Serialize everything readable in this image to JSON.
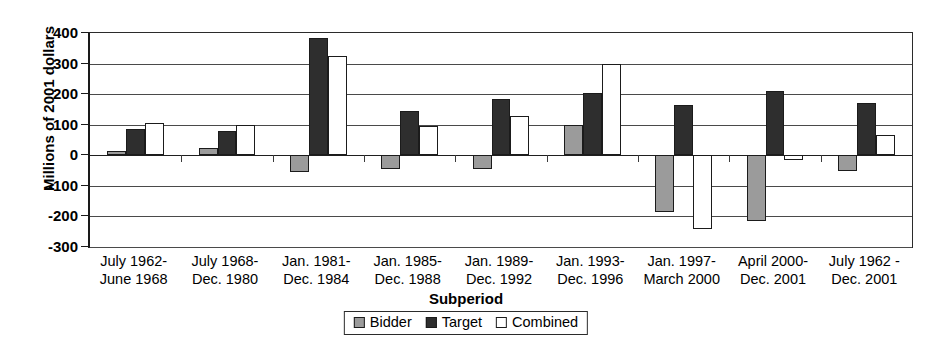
{
  "chart_data": {
    "type": "bar",
    "title": "",
    "xlabel": "Subperiod",
    "ylabel": "Millions of 2001 dollars",
    "ylim": [
      -300,
      400
    ],
    "ytick_step": 100,
    "yticks": [
      400,
      300,
      200,
      100,
      0,
      -100,
      -200,
      -300
    ],
    "ytick_labels": [
      "400",
      "300",
      "200",
      "100",
      "0",
      "-100",
      "-200",
      "-300"
    ],
    "grid": true,
    "legend_position": "bottom-center",
    "categories": [
      "July 1962-\nJune 1968",
      "July 1968-\nDec. 1980",
      "Jan. 1981-\nDec. 1984",
      "Jan. 1985-\nDec. 1988",
      "Jan. 1989-\nDec. 1992",
      "Jan. 1993-\nDec. 1996",
      "Jan. 1997-\nMarch 2000",
      "April 2000-\nDec. 2001",
      "July 1962 -\nDec. 2001"
    ],
    "category_lines": [
      [
        "July 1962-",
        "June 1968"
      ],
      [
        "July 1968-",
        "Dec. 1980"
      ],
      [
        "Jan. 1981-",
        "Dec. 1984"
      ],
      [
        "Jan. 1985-",
        "Dec. 1988"
      ],
      [
        "Jan. 1989-",
        "Dec. 1992"
      ],
      [
        "Jan. 1993-",
        "Dec. 1996"
      ],
      [
        "Jan. 1997-",
        "March 2000"
      ],
      [
        "April 2000-",
        "Dec. 2001"
      ],
      [
        "July 1962 -",
        "Dec. 2001"
      ]
    ],
    "series": [
      {
        "name": "Bidder",
        "color": "#9b9b9b",
        "values": [
          15,
          25,
          -55,
          -45,
          -45,
          100,
          -185,
          -215,
          -50
        ]
      },
      {
        "name": "Target",
        "color": "#2e2e2e",
        "values": [
          85,
          80,
          385,
          145,
          185,
          205,
          165,
          210,
          170
        ]
      },
      {
        "name": "Combined",
        "color": "#ffffff",
        "values": [
          105,
          100,
          325,
          95,
          130,
          300,
          -240,
          -15,
          65
        ]
      }
    ]
  },
  "legend": {
    "items": [
      {
        "label": "Bidder",
        "swatch": "bidder"
      },
      {
        "label": "Target",
        "swatch": "target"
      },
      {
        "label": "Combined",
        "swatch": "combined"
      }
    ]
  }
}
